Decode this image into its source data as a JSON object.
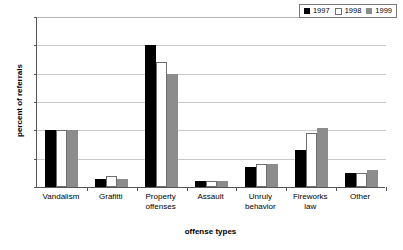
{
  "chart_data": {
    "type": "bar",
    "title": "",
    "xlabel": "offense types",
    "ylabel": "percent of referrals",
    "ylim": [
      0,
      60
    ],
    "yticks": [
      0,
      10,
      20,
      30,
      40,
      50,
      60
    ],
    "grid": true,
    "legend_position": "top-right",
    "categories": [
      "Vandalism",
      "Grafitti",
      "Property offenses",
      "Assault",
      "Unruly behavior",
      "Fireworks law",
      "Other"
    ],
    "category_lines": [
      [
        "Vandalism"
      ],
      [
        "Grafitti"
      ],
      [
        "Property",
        "offenses"
      ],
      [
        "Assault"
      ],
      [
        "Unruly",
        "behavior"
      ],
      [
        "Fireworks",
        "law"
      ],
      [
        "Other"
      ]
    ],
    "series": [
      {
        "name": "1997",
        "color": "#000000",
        "values": [
          20,
          3,
          50,
          2,
          7,
          13,
          5
        ]
      },
      {
        "name": "1998",
        "color": "#ffffff",
        "values": [
          20,
          4,
          44,
          2,
          8,
          19,
          5
        ]
      },
      {
        "name": "1999",
        "color": "#8c8c8c",
        "values": [
          20,
          3,
          40,
          2,
          8,
          21,
          6
        ]
      }
    ]
  },
  "colors": {
    "axis": "#555555",
    "gridline": "#c9c9c9",
    "legend_border": "#7a7a7a",
    "background": "#ffffff"
  }
}
